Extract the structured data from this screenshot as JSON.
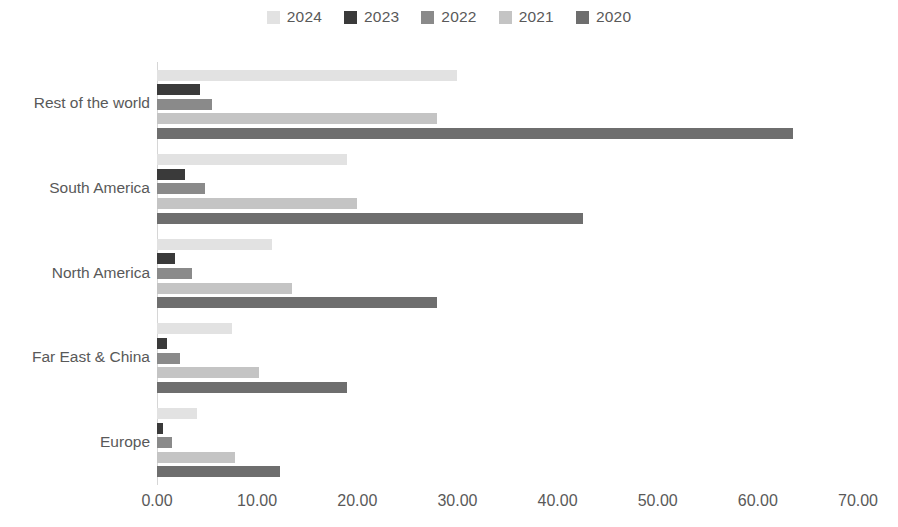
{
  "chart": {
    "type": "bar",
    "orientation": "horizontal",
    "title": "",
    "xlabel": "",
    "ylabel": "",
    "background_color": "#ffffff",
    "axis_line_color": "#d6d6d6",
    "text_color": "#595959",
    "grid": false,
    "legend_position": "top-center"
  },
  "chart_data": {
    "type": "bar",
    "title": "",
    "xlabel": "",
    "ylabel": "",
    "xlim": [
      0,
      70
    ],
    "ylim": null,
    "grid": false,
    "legend_position": "top-center",
    "orientation": "horizontal",
    "categories": [
      "Rest of the world",
      "South America",
      "North America",
      "Far East & China",
      "Europe"
    ],
    "xticks": [
      "0.00",
      "10.00",
      "20.00",
      "30.00",
      "40.00",
      "50.00",
      "60.00",
      "70.00"
    ],
    "xtick_values": [
      0,
      10,
      20,
      30,
      40,
      50,
      60,
      70
    ],
    "series": [
      {
        "name": "2024",
        "color": "#e2e2e2",
        "values": [
          30.0,
          19.0,
          11.5,
          7.5,
          4.0
        ]
      },
      {
        "name": "2023",
        "color": "#3a3a3a",
        "values": [
          4.3,
          2.8,
          1.8,
          1.0,
          0.6
        ]
      },
      {
        "name": "2022",
        "color": "#8a8a8a",
        "values": [
          5.5,
          4.8,
          3.5,
          2.3,
          1.5
        ]
      },
      {
        "name": "2021",
        "color": "#c4c4c4",
        "values": [
          28.0,
          20.0,
          13.5,
          10.2,
          7.8
        ]
      },
      {
        "name": "2020",
        "color": "#6e6e6e",
        "values": [
          63.5,
          42.5,
          28.0,
          19.0,
          12.3
        ]
      }
    ]
  },
  "legend": {
    "items": [
      {
        "label": "2024",
        "color": "#e2e2e2"
      },
      {
        "label": "2023",
        "color": "#3a3a3a"
      },
      {
        "label": "2022",
        "color": "#8a8a8a"
      },
      {
        "label": "2021",
        "color": "#c4c4c4"
      },
      {
        "label": "2020",
        "color": "#6e6e6e"
      }
    ]
  }
}
